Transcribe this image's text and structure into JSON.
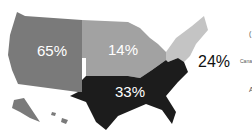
{
  "map": {
    "regions": [
      {
        "name": "West",
        "value": "65%",
        "color": "#7a7a7a"
      },
      {
        "name": "Midwest",
        "value": "14%",
        "color": "#a2a2a2"
      },
      {
        "name": "Northeast",
        "value": "24%",
        "color": "#c4c4c4"
      },
      {
        "name": "South",
        "value": "33%",
        "color": "#1c1c1c"
      }
    ],
    "edge_labels": {
      "canada_partial": "Cana",
      "glyph_top": "(",
      "glyph_bottom": "A"
    }
  }
}
